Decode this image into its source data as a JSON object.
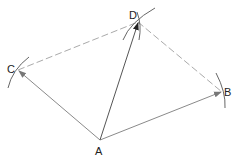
{
  "diagram": {
    "points": {
      "A": {
        "label": "A",
        "x": 100,
        "y": 140
      },
      "B": {
        "label": "B",
        "x": 222,
        "y": 92
      },
      "C": {
        "label": "C",
        "x": 18,
        "y": 70
      },
      "D": {
        "label": "D",
        "x": 138,
        "y": 22
      }
    },
    "colors": {
      "vector": "#8a8a8a",
      "resultant": "#555555",
      "dashed": "#aaaaaa",
      "arc": "#666666",
      "label": "#222222"
    }
  }
}
